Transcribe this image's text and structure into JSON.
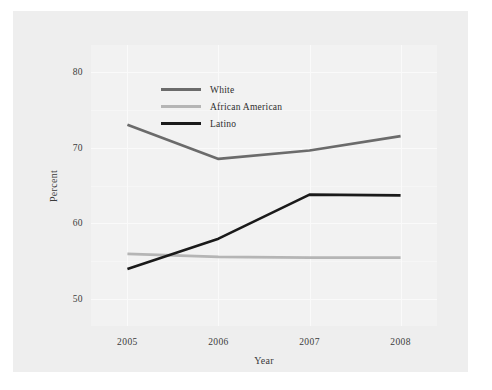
{
  "chart_data": {
    "type": "line",
    "title": "",
    "xlabel": "Year",
    "ylabel": "Percent",
    "x": [
      2005,
      2006,
      2007,
      2008
    ],
    "xticklabels": [
      "2005",
      "2006",
      "2007",
      "2008"
    ],
    "yticks": [
      50,
      60,
      70,
      80
    ],
    "yticklabels": [
      "50",
      "60",
      "70",
      "80"
    ],
    "ylim": [
      46.5,
      83.5
    ],
    "xlim": [
      2004.6,
      2008.4
    ],
    "grid": true,
    "legend_position": "upper left",
    "series": [
      {
        "name": "White",
        "color": "#6b6b6b",
        "values": [
          73.0,
          68.5,
          69.6,
          71.5
        ]
      },
      {
        "name": "African American",
        "color": "#b5b5b5",
        "values": [
          56.0,
          55.6,
          55.5,
          55.5
        ]
      },
      {
        "name": "Latino",
        "color": "#1a1a1a",
        "values": [
          54.0,
          58.0,
          63.8,
          63.7
        ]
      }
    ]
  },
  "legend": {
    "items": [
      {
        "label": "White",
        "color": "#6b6b6b"
      },
      {
        "label": "African American",
        "color": "#b5b5b5"
      },
      {
        "label": "Latino",
        "color": "#1a1a1a"
      }
    ]
  },
  "colors": {
    "figure_background": "#eeeeee",
    "panel_background": "#f2f2f2",
    "grid": "#fafafa",
    "text": "#3b3b3b"
  }
}
